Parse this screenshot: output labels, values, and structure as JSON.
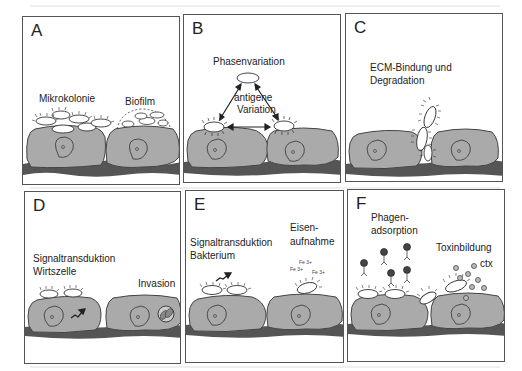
{
  "figure": {
    "panels": [
      {
        "id": "A",
        "letter": "A",
        "labels": {
          "left": "Mikrokolonie",
          "right": "Biofilm"
        }
      },
      {
        "id": "B",
        "letter": "B",
        "labels": {
          "title": "Phasenvariation",
          "center_line1": "antigene",
          "center_line2": "Variation"
        }
      },
      {
        "id": "C",
        "letter": "C",
        "labels": {
          "line1": "ECM-Bindung und",
          "line2": "Degradation"
        }
      },
      {
        "id": "D",
        "letter": "D",
        "labels": {
          "line1": "Signaltransduktion",
          "line2": "Wirtszelle",
          "right": "Invasion"
        }
      },
      {
        "id": "E",
        "letter": "E",
        "labels": {
          "line1": "Signaltransduktion",
          "line2": "Bakterium",
          "right1": "Eisen-",
          "right2": "aufnahme",
          "fe1": "Fe 3+",
          "fe2": "Fe 3+",
          "fe3": "Fe 3+"
        }
      },
      {
        "id": "F",
        "letter": "F",
        "labels": {
          "left1": "Phagen-",
          "left2": "adsorption",
          "right": "Toxinbildung",
          "toxin": "ctx"
        }
      }
    ],
    "colors": {
      "cell": "#a9a9a9",
      "ecm": "#555555",
      "border": "#555555",
      "text": "#222222"
    }
  }
}
